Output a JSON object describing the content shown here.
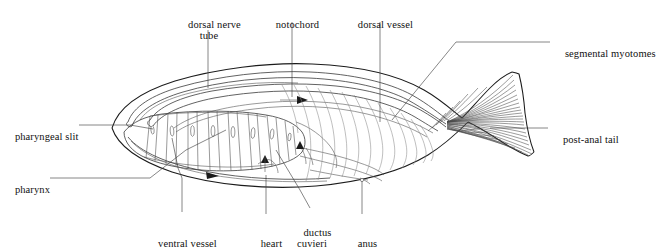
{
  "figure": {
    "organism": "amphioxus",
    "view": "lateral",
    "background_color": "#ffffff",
    "line_color": "#1b1b1b"
  },
  "labels": {
    "dorsal_nerve_tube": "dorsal nerve\ntube",
    "notochord": "notochord",
    "dorsal_vessel": "dorsal vessel",
    "segmental_myotomes": "segmental myotomes",
    "post_anal_tail": "post-anal tail",
    "pharyngeal_slit": "pharyngeal slit",
    "pharynx": "pharynx",
    "ventral_vessel": "ventral vessel",
    "heart": "heart",
    "ductus_cuvieri": "ductus\ncuvieri",
    "anus": "anus"
  },
  "structures": [
    {
      "name": "body-outline",
      "label": ""
    },
    {
      "name": "dorsal-nerve-tube",
      "label": "dorsal nerve tube"
    },
    {
      "name": "notochord",
      "label": "notochord"
    },
    {
      "name": "dorsal-vessel",
      "label": "dorsal vessel"
    },
    {
      "name": "pharynx",
      "label": "pharynx"
    },
    {
      "name": "pharyngeal-slits",
      "label": "pharyngeal slit"
    },
    {
      "name": "ventral-vessel",
      "label": "ventral vessel"
    },
    {
      "name": "heart",
      "label": "heart"
    },
    {
      "name": "ductus-cuvieri",
      "label": "ductus cuvieri"
    },
    {
      "name": "anus",
      "label": "anus"
    },
    {
      "name": "segmental-myotomes",
      "label": "segmental myotomes"
    },
    {
      "name": "post-anal-tail",
      "label": "post-anal tail"
    },
    {
      "name": "caudal-fin",
      "label": ""
    }
  ],
  "flow_arrows": [
    {
      "name": "dorsal-blood-flow-arrow",
      "direction": "posterior",
      "glyph": "right-triangle"
    },
    {
      "name": "ventral-blood-flow-arrow",
      "direction": "anterior",
      "glyph": "left-triangle"
    }
  ],
  "counts": {
    "pharyngeal_bars": 8,
    "caudal_fin_rays": 46
  }
}
